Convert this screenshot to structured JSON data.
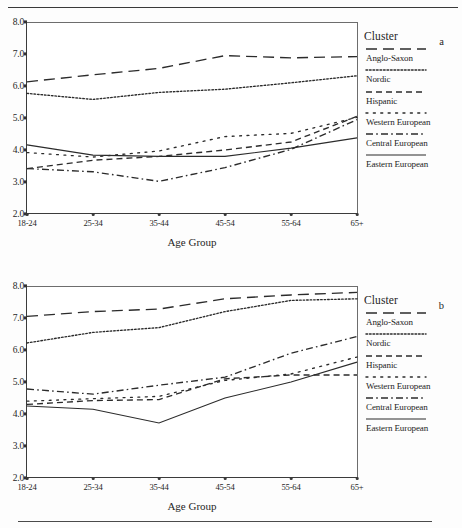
{
  "figure": {
    "panels": [
      {
        "letter": "a",
        "legend_title": "Cluster",
        "chart_index": 0
      },
      {
        "letter": "b",
        "legend_title": "Cluster",
        "chart_index": 1
      }
    ]
  },
  "chart_data": [
    {
      "type": "line",
      "title": "",
      "panel_label": "a",
      "xlabel": "Age Group",
      "ylabel": "",
      "categories": [
        "18-24",
        "25-34",
        "35-44",
        "45-54",
        "55-64",
        "65+"
      ],
      "ylim": [
        2.0,
        8.0
      ],
      "ytick_labels": [
        "2.0",
        "3.0",
        "4.0",
        "5.0",
        "6.0",
        "7.0",
        "8.0"
      ],
      "yticks": [
        2.0,
        3.0,
        4.0,
        5.0,
        6.0,
        7.0,
        8.0
      ],
      "grid": false,
      "legend_title": "Cluster",
      "legend_position": "right",
      "series": [
        {
          "name": "Anglo-Saxon",
          "dash": "long-dash",
          "values": [
            6.13,
            6.35,
            6.55,
            6.95,
            6.88,
            6.92
          ]
        },
        {
          "name": "Nordic",
          "dash": "fine-dot",
          "values": [
            5.77,
            5.58,
            5.8,
            5.9,
            6.1,
            6.32
          ]
        },
        {
          "name": "Hispanic",
          "dash": "dash",
          "values": [
            3.42,
            3.68,
            3.8,
            4.0,
            4.25,
            5.05
          ]
        },
        {
          "name": "Western European",
          "dash": "sparse-dot",
          "values": [
            3.92,
            3.78,
            3.97,
            4.42,
            4.52,
            5.02
          ]
        },
        {
          "name": "Central European",
          "dash": "dash-dot",
          "values": [
            3.42,
            3.32,
            3.02,
            3.45,
            4.02,
            4.95
          ]
        },
        {
          "name": "Eastern European",
          "dash": "solid",
          "values": [
            4.16,
            3.84,
            3.8,
            3.8,
            4.06,
            4.38
          ]
        }
      ]
    },
    {
      "type": "line",
      "title": "",
      "panel_label": "b",
      "xlabel": "Age Group",
      "ylabel": "",
      "categories": [
        "18-24",
        "25-34",
        "35-44",
        "45-54",
        "55-64",
        "65+"
      ],
      "ylim": [
        2.0,
        8.0
      ],
      "ytick_labels": [
        "2.0",
        "3.0",
        "4.0",
        "5.0",
        "6.0",
        "7.0",
        "8.0"
      ],
      "yticks": [
        2.0,
        3.0,
        4.0,
        5.0,
        6.0,
        7.0,
        8.0
      ],
      "grid": false,
      "legend_title": "Cluster",
      "legend_position": "right",
      "series": [
        {
          "name": "Anglo-Saxon",
          "dash": "long-dash",
          "values": [
            7.05,
            7.2,
            7.28,
            7.6,
            7.72,
            7.8
          ]
        },
        {
          "name": "Nordic",
          "dash": "fine-dot",
          "values": [
            6.22,
            6.55,
            6.7,
            7.2,
            7.55,
            7.6
          ]
        },
        {
          "name": "Hispanic",
          "dash": "dash",
          "values": [
            4.3,
            4.42,
            4.45,
            5.1,
            5.22,
            5.22
          ]
        },
        {
          "name": "Western European",
          "dash": "sparse-dot",
          "values": [
            4.4,
            4.48,
            4.55,
            5.05,
            5.25,
            5.78
          ]
        },
        {
          "name": "Central European",
          "dash": "dash-dot",
          "values": [
            4.78,
            4.62,
            4.9,
            5.15,
            5.9,
            6.42
          ]
        },
        {
          "name": "Eastern European",
          "dash": "solid",
          "values": [
            4.25,
            4.15,
            3.72,
            4.5,
            5.0,
            5.62
          ]
        }
      ]
    }
  ]
}
